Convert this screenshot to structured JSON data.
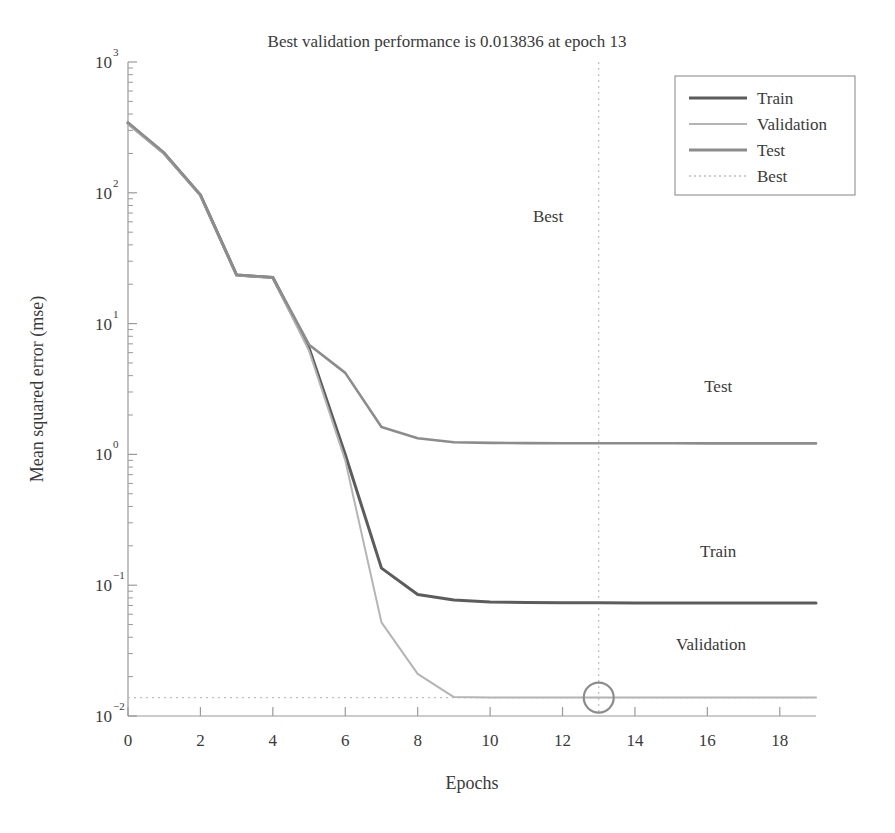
{
  "chart_data": {
    "type": "line",
    "title": "Best validation performance is 0.013836 at epoch 13",
    "xlabel": "Epochs",
    "ylabel": "Mean squared error (mse)",
    "yscale": "log",
    "ylim": [
      0.01,
      1000
    ],
    "xlim": [
      0,
      19
    ],
    "grid": false,
    "legend_position": "top-right",
    "x": [
      0,
      1,
      2,
      3,
      4,
      5,
      6,
      7,
      8,
      9,
      10,
      11,
      12,
      13,
      14,
      15,
      16,
      17,
      18,
      19
    ],
    "series": [
      {
        "name": "Train",
        "color": "#5c5c5c",
        "linewidth": 3.0,
        "values": [
          340,
          200,
          96,
          23.5,
          22.5,
          6.5,
          1.0,
          0.135,
          0.085,
          0.077,
          0.0745,
          0.0738,
          0.0735,
          0.0733,
          0.0732,
          0.0731,
          0.0731,
          0.073,
          0.073,
          0.073
        ]
      },
      {
        "name": "Validation",
        "color": "#b4b4b4",
        "linewidth": 2.0,
        "values": [
          335,
          198,
          95,
          23.4,
          22.4,
          6.2,
          0.9,
          0.052,
          0.021,
          0.01395,
          0.01386,
          0.013845,
          0.01384,
          0.013836,
          0.01384,
          0.013845,
          0.01385,
          0.013855,
          0.01386,
          0.013865
        ]
      },
      {
        "name": "Test",
        "color": "#8c8c8c",
        "linewidth": 2.6,
        "values": [
          345,
          202,
          97,
          23.6,
          22.6,
          6.9,
          4.2,
          1.62,
          1.33,
          1.24,
          1.225,
          1.22,
          1.218,
          1.217,
          1.216,
          1.216,
          1.215,
          1.215,
          1.215,
          1.214
        ]
      }
    ],
    "best": {
      "name": "Best",
      "epoch": 13,
      "value": 0.013836,
      "color": "#b4b4b4",
      "marker": "circle"
    },
    "xticks": [
      "0",
      "2",
      "4",
      "6",
      "8",
      "10",
      "12",
      "14",
      "16",
      "18"
    ],
    "xtick_values": [
      0,
      2,
      4,
      6,
      8,
      10,
      12,
      14,
      16,
      18
    ],
    "yticks": [
      {
        "mantissa": "10",
        "exponent": "3",
        "value": 1000
      },
      {
        "mantissa": "10",
        "exponent": "2",
        "value": 100
      },
      {
        "mantissa": "10",
        "exponent": "1",
        "value": 10
      },
      {
        "mantissa": "10",
        "exponent": "0",
        "value": 1
      },
      {
        "mantissa": "10",
        "exponent": "−1",
        "value": 0.1
      },
      {
        "mantissa": "10",
        "exponent": "−2",
        "value": 0.01
      }
    ],
    "annotations": [
      {
        "label": "Best",
        "x": 11.6,
        "y": 60
      },
      {
        "label": "Test",
        "x": 16.3,
        "y": 3.0
      },
      {
        "label": "Train",
        "x": 16.3,
        "y": 0.165
      },
      {
        "label": "Validation",
        "x": 16.1,
        "y": 0.032
      }
    ]
  },
  "legend": {
    "items": [
      {
        "label": "Train",
        "color": "#5c5c5c",
        "style": "solid",
        "width": 3.2
      },
      {
        "label": "Validation",
        "color": "#b4b4b4",
        "style": "solid",
        "width": 2.2
      },
      {
        "label": "Test",
        "color": "#8c8c8c",
        "style": "solid",
        "width": 2.8
      },
      {
        "label": "Best",
        "color": "#bdbdbd",
        "style": "dotted",
        "width": 1.4
      }
    ],
    "border_color": "#8f8f8f"
  },
  "axes": {
    "line_color": "#9a9a9a",
    "tick_color": "#9a9a9a",
    "text_color": "#3a3a3a"
  }
}
